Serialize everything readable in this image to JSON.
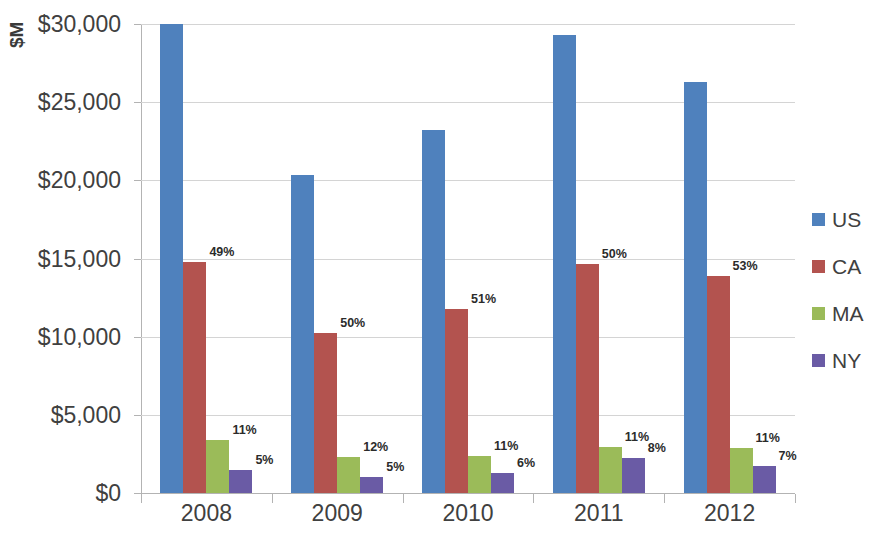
{
  "chart_data": {
    "type": "bar",
    "title": "",
    "subtitle": "",
    "xlabel": "",
    "ylabel": "$M",
    "categories": [
      "2008",
      "2009",
      "2010",
      "2011",
      "2012"
    ],
    "ylim": [
      0,
      30000
    ],
    "yticks": [
      0,
      5000,
      10000,
      15000,
      20000,
      25000,
      30000
    ],
    "ytick_labels": [
      "$0",
      "$5,000",
      "$10,000",
      "$15,000",
      "$20,000",
      "$25,000",
      "$30,000"
    ],
    "grid": true,
    "legend_position": "right",
    "series": [
      {
        "name": "US",
        "color": "#4f81bd",
        "values": [
          30000,
          20350,
          23250,
          29300,
          26300
        ],
        "labels": [
          "",
          "",
          "",
          "",
          ""
        ]
      },
      {
        "name": "CA",
        "color": "#b3534f",
        "values": [
          14800,
          10250,
          11800,
          14650,
          13900
        ],
        "labels": [
          "49%",
          "50%",
          "51%",
          "50%",
          "53%"
        ]
      },
      {
        "name": "MA",
        "color": "#9bbb59",
        "values": [
          3400,
          2300,
          2350,
          2950,
          2850
        ],
        "labels": [
          "11%",
          "12%",
          "11%",
          "11%",
          "11%"
        ]
      },
      {
        "name": "NY",
        "color": "#6a5ba5",
        "values": [
          1500,
          1000,
          1250,
          2250,
          1700
        ],
        "labels": [
          "5%",
          "5%",
          "6%",
          "8%",
          "7%"
        ]
      }
    ]
  }
}
